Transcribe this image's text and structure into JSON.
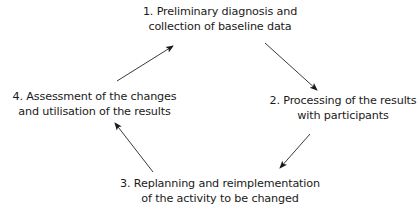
{
  "diagram": {
    "type": "cycle",
    "colors": {
      "text": "#1a1a1a",
      "arrow": "#3a3a3a",
      "background": "#ffffff"
    },
    "nodes": [
      {
        "id": "1",
        "line1": "1.  Preliminary diagnosis and",
        "line2": "collection of baseline data"
      },
      {
        "id": "2",
        "line1": "2.  Processing of the results",
        "line2": "with participants"
      },
      {
        "id": "3",
        "line1": "3.  Replanning and reimplementation",
        "line2": "of the activity to be changed"
      },
      {
        "id": "4",
        "line1": "4.  Assessment of the changes",
        "line2": "and utilisation of the results"
      }
    ],
    "edges": [
      {
        "from": "1",
        "to": "2"
      },
      {
        "from": "2",
        "to": "3"
      },
      {
        "from": "3",
        "to": "4"
      },
      {
        "from": "4",
        "to": "1"
      }
    ]
  }
}
